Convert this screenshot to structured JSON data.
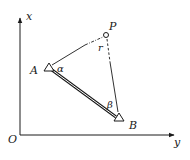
{
  "diagram": {
    "type": "surveying-intersection-geometry",
    "axes": {
      "vertical_label": "x",
      "horizontal_label": "y",
      "origin_label": "O"
    },
    "points": {
      "A": {
        "label": "A",
        "symbol": "triangle"
      },
      "B": {
        "label": "B",
        "symbol": "triangle"
      },
      "P": {
        "label": "P",
        "symbol": "circle"
      }
    },
    "angles": {
      "alpha": "α",
      "beta": "β",
      "gamma": "r"
    },
    "edges": [
      {
        "from": "A",
        "to": "B",
        "style": "double-line"
      },
      {
        "from": "A",
        "to": "P",
        "style": "solid-then-dash-dot"
      },
      {
        "from": "B",
        "to": "P",
        "style": "solid-then-dashed"
      }
    ],
    "colors": {
      "stroke": "#1a1a1a",
      "background": "#ffffff"
    }
  }
}
